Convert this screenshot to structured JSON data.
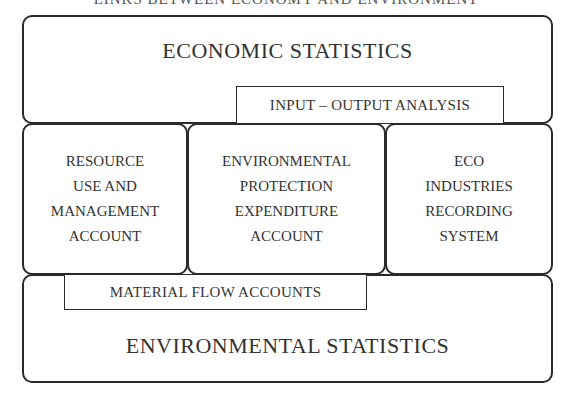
{
  "diagram": {
    "title_cropped": "LINKS BETWEEN ECONOMY AND ENVIRONMENT",
    "top_box": {
      "label": "ECONOMIC STATISTICS"
    },
    "top_inset": {
      "label": "INPUT – OUTPUT ANALYSIS"
    },
    "middle_boxes": [
      {
        "label": "RESOURCE\nUSE AND\nMANAGEMENT\nACCOUNT"
      },
      {
        "label": "ENVIRONMENTAL\nPROTECTION\nEXPENDITURE\nACCOUNT"
      },
      {
        "label": "ECO\nINDUSTRIES\nRECORDING\nSYSTEM"
      }
    ],
    "bottom_inset": {
      "label": "MATERIAL FLOW ACCOUNTS"
    },
    "bottom_box": {
      "label": "ENVIRONMENTAL STATISTICS"
    },
    "colors": {
      "stroke": "#2a2a2a",
      "text": "#333333",
      "background": "#ffffff"
    }
  }
}
